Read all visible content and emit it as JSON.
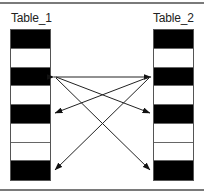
{
  "diagram": {
    "tables": [
      {
        "id": "table_1",
        "label": "Table_1",
        "rows": [
          "black",
          "white",
          "black",
          "white",
          "black",
          "white",
          "white",
          "black"
        ]
      },
      {
        "id": "table_2",
        "label": "Table_2",
        "rows": [
          "black",
          "white",
          "black",
          "white",
          "black",
          "white",
          "white",
          "black"
        ]
      }
    ],
    "connections": [
      {
        "from": "Table_1 row 3",
        "to": "Table_2 row 3",
        "bidirectional": true
      },
      {
        "from": "Table_1 row 3",
        "to": "Table_2 row 5"
      },
      {
        "from": "Table_1 row 3",
        "to": "Table_2 row 8"
      },
      {
        "from": "Table_2 row 3",
        "to": "Table_1 row 5"
      },
      {
        "from": "Table_2 row 3",
        "to": "Table_1 row 8"
      }
    ]
  }
}
